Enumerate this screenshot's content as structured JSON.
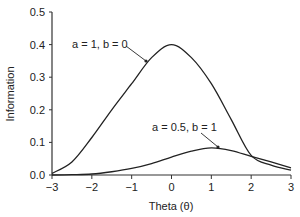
{
  "chart_data": {
    "type": "line",
    "title": "",
    "xlabel": "Theta (θ)",
    "ylabel": "Information",
    "xlim": [
      -3,
      3
    ],
    "ylim": [
      0,
      0.5
    ],
    "xticks": [
      "−3",
      "−2",
      "−1",
      "0",
      "1",
      "2",
      "3"
    ],
    "yticks": [
      "0.0",
      "0.1",
      "0.2",
      "0.3",
      "0.4",
      "0.5"
    ],
    "grid": false,
    "legend": "none (inline annotations with arrows)",
    "x": [
      -3,
      -2.5,
      -2,
      -1.5,
      -1,
      -0.5,
      0,
      0.5,
      1,
      1.5,
      2,
      2.5,
      3
    ],
    "series": [
      {
        "name": "a = 1, b = 0",
        "values": [
          0.005,
          0.04,
          0.115,
          0.2,
          0.28,
          0.36,
          0.4,
          0.36,
          0.28,
          0.17,
          0.06,
          0.03,
          0.015
        ]
      },
      {
        "name": "a = 0.5, b = 1",
        "values": [
          0.0,
          0.001,
          0.003,
          0.01,
          0.02,
          0.035,
          0.055,
          0.073,
          0.083,
          0.075,
          0.057,
          0.04,
          0.022
        ]
      }
    ],
    "annotations": [
      {
        "text": "a = 1, b = 0",
        "arrow_to_theta": -0.2
      },
      {
        "text": "a = 0.5, b = 1",
        "arrow_to_theta": 1.2
      }
    ]
  }
}
